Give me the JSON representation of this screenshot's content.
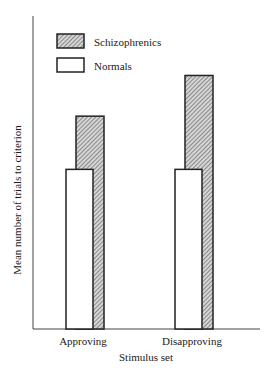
{
  "chart_data": {
    "type": "bar",
    "title": "",
    "xlabel": "Stimulus set",
    "ylabel": "Mean number of trials to criterion",
    "categories": [
      "Approving",
      "Disapproving"
    ],
    "series": [
      {
        "name": "Schizophrenics",
        "pattern": "hatched",
        "values": [
          68,
          81
        ]
      },
      {
        "name": "Normals",
        "pattern": "white",
        "values": [
          51,
          51
        ]
      }
    ],
    "ylim": [
      0,
      100
    ],
    "yticks": "none (relative units)",
    "grid": false,
    "legend": {
      "placement": "top-left",
      "entries": [
        "Schizophrenics",
        "Normals"
      ]
    },
    "colors": {
      "ink": "#2a2a2a",
      "hatch_bg": "#cfcfcf",
      "normals_fill": "#ffffff"
    }
  }
}
